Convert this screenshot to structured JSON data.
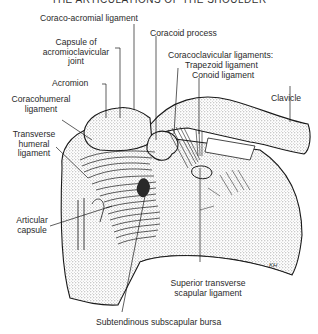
{
  "title": "THE ARTICULATIONS OF THE SHOULDER",
  "labels": {
    "coraco_acromial": "Coraco-acromial ligament",
    "capsule_ac_1": "Capsule of",
    "capsule_ac_2": "acromioclavicular",
    "capsule_ac_3": "joint",
    "coracoid": "Coracoid process",
    "acromion": "Acromion",
    "coracoclavicular": "Coracoclavicular ligaments:",
    "trapezoid": "Trapezoid ligament",
    "conoid": "Conoid ligament",
    "coracohumeral_1": "Coracohumeral",
    "coracohumeral_2": "ligament",
    "clavicle": "Clavicle",
    "transverse_humeral_1": "Transverse",
    "transverse_humeral_2": "humeral",
    "transverse_humeral_3": "ligament",
    "articular_1": "Articular",
    "articular_2": "capsule",
    "sup_transverse_1": "Superior transverse",
    "sup_transverse_2": "scapular ligament",
    "subtendinous": "Subtendinous subscapular bursa"
  },
  "signature": "KH",
  "colors": {
    "ink": "#1a1a1a",
    "stipple": "#9a9a9a",
    "paper": "#ffffff"
  }
}
